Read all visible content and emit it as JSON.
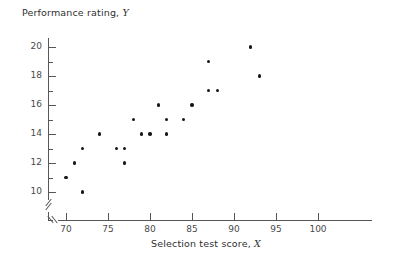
{
  "chart_data": {
    "type": "scatter",
    "title": "",
    "xlabel": "Selection test score, X",
    "ylabel": "Performance rating, Y",
    "xlim": [
      68,
      101
    ],
    "ylim": [
      9,
      21
    ],
    "grid": false,
    "legend": null,
    "axis_break_x": true,
    "axis_break_y": true,
    "xticks": [
      70,
      75,
      80,
      85,
      90,
      95,
      100
    ],
    "yticks": [
      10,
      12,
      14,
      16,
      18,
      20
    ],
    "y_minor_ticks": [
      11,
      13,
      15,
      17,
      19,
      21
    ],
    "x": [
      70,
      71,
      72,
      72,
      74,
      76,
      77,
      77,
      78,
      79,
      80,
      81,
      82,
      82,
      84,
      85,
      87,
      87,
      88,
      92,
      93
    ],
    "y": [
      11,
      12,
      13,
      10,
      14,
      13,
      13,
      12,
      15,
      14,
      14,
      16,
      14,
      15,
      15,
      16,
      19,
      17,
      17,
      20,
      18
    ],
    "points": [
      {
        "x": 70,
        "y": 11
      },
      {
        "x": 71,
        "y": 12
      },
      {
        "x": 72,
        "y": 13
      },
      {
        "x": 72,
        "y": 10
      },
      {
        "x": 74,
        "y": 14
      },
      {
        "x": 76,
        "y": 13
      },
      {
        "x": 77,
        "y": 13
      },
      {
        "x": 77,
        "y": 12
      },
      {
        "x": 78,
        "y": 15
      },
      {
        "x": 79,
        "y": 14
      },
      {
        "x": 80,
        "y": 14
      },
      {
        "x": 81,
        "y": 16
      },
      {
        "x": 82,
        "y": 14
      },
      {
        "x": 82,
        "y": 15
      },
      {
        "x": 84,
        "y": 15
      },
      {
        "x": 85,
        "y": 16
      },
      {
        "x": 87,
        "y": 19
      },
      {
        "x": 87,
        "y": 17
      },
      {
        "x": 88,
        "y": 17
      },
      {
        "x": 92,
        "y": 20
      },
      {
        "x": 93,
        "y": 18
      }
    ]
  },
  "labels": {
    "y_axis_title_text": "Performance rating, ",
    "y_axis_title_var": "Y",
    "x_axis_title_text": "Selection test score, ",
    "x_axis_title_var": "X"
  },
  "colors": {
    "point": "#17171a",
    "axis": "#56565a",
    "text": "#3a3a3a",
    "background": "#ffffff"
  }
}
